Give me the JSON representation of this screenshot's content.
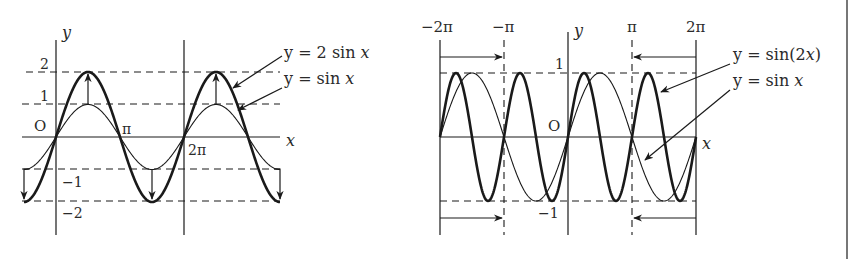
{
  "chart_data": [
    {
      "type": "line",
      "title": "",
      "xlabel": "x",
      "ylabel": "y",
      "origin_label": "O",
      "x_tick_labels": [
        "π",
        "2π"
      ],
      "x_ticks": [
        3.14159,
        6.28319
      ],
      "y_tick_labels": [
        "2",
        "1",
        "−1",
        "−2"
      ],
      "y_ticks": [
        2,
        1,
        -1,
        -2
      ],
      "xlim": [
        -1.6,
        10.6
      ],
      "ylim": [
        -2,
        2
      ],
      "grid": false,
      "guide_lines": "dashed horizontal lines at y = 2, 1, −1, −2",
      "annotation": "vertical arrows at peaks/troughs show stretching from y = sin x to y = 2 sin x",
      "series": [
        {
          "name": "y = 2 sin x",
          "style": "thick",
          "formula": "2*sin(x)"
        },
        {
          "name": "y = sin x",
          "style": "thin",
          "formula": "sin(x)"
        }
      ],
      "legend": [
        {
          "label": "y = 2 sin x",
          "target": "thick curve"
        },
        {
          "label": "y = sin x",
          "target": "thin curve"
        }
      ]
    },
    {
      "type": "line",
      "title": "",
      "xlabel": "x",
      "ylabel": "y",
      "origin_label": "O",
      "x_tick_labels": [
        "−2π",
        "−π",
        "π",
        "2π"
      ],
      "x_ticks": [
        -6.28319,
        -3.14159,
        3.14159,
        6.28319
      ],
      "y_tick_labels": [
        "1",
        "−1"
      ],
      "y_ticks": [
        1,
        -1
      ],
      "xlim": [
        -6.28319,
        6.28319
      ],
      "ylim": [
        -1,
        1
      ],
      "grid": false,
      "guide_lines": "dashed horizontal lines at y = 1 and y = −1; dashed vertical lines at x = −π and x = π",
      "annotation": "horizontal arrows from −2π to −π and from 2π to π show compression by factor 2",
      "series": [
        {
          "name": "y = sin(2x)",
          "style": "thick",
          "formula": "sin(2*x)"
        },
        {
          "name": "y = sin x",
          "style": "thin",
          "formula": "sin(x)"
        }
      ],
      "legend": [
        {
          "label": "y = sin(2x)",
          "target": "thick curve"
        },
        {
          "label": "y = sin x",
          "target": "thin curve"
        }
      ]
    }
  ],
  "left_graph": {
    "axis_x": "x",
    "axis_y": "y",
    "origin": "O",
    "tick_pi": "π",
    "tick_2pi": "2π",
    "tick_2": "2",
    "tick_1": "1",
    "tick_m1": "−1",
    "tick_m2": "−2",
    "label_2sin_pre": "y = 2 sin ",
    "label_2sin_var": "x",
    "label_sin_pre": "y = sin ",
    "label_sin_var": "x"
  },
  "right_graph": {
    "axis_x": "x",
    "axis_y": "y",
    "origin": "O",
    "tick_m2pi": "−2π",
    "tick_mpi": "−π",
    "tick_pi": "π",
    "tick_2pi": "2π",
    "tick_1": "1",
    "tick_m1": "−1",
    "label_sin2x_pre": "y = sin(2",
    "label_sin2x_var": "x",
    "label_sin2x_post": ")",
    "label_sin_pre": "y = sin ",
    "label_sin_var": "x"
  },
  "colors": {
    "ink": "#1a1a1a",
    "text": "#2a2a2a",
    "border": "#777777",
    "background": "#ffffff"
  }
}
